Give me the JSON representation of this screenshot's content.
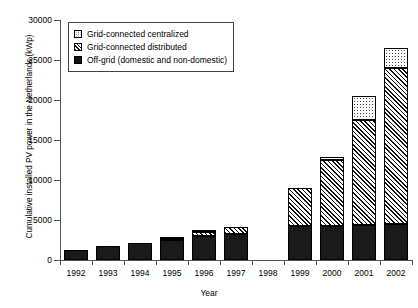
{
  "chart_data": {
    "type": "bar",
    "stacked": true,
    "title": "",
    "xlabel": "Year",
    "ylabel": "Cumulative installed PV power in the Netherlands (kWp)",
    "categories": [
      "1992",
      "1993",
      "1994",
      "1995",
      "1996",
      "1997",
      "1998",
      "1999",
      "2000",
      "2001",
      "2002"
    ],
    "ylim": [
      0,
      30000
    ],
    "yticks": [
      0,
      5000,
      10000,
      15000,
      20000,
      25000,
      30000
    ],
    "ytick_labels": [
      "0",
      "5000",
      "10000",
      "15000",
      "20000",
      "25000",
      "30000"
    ],
    "grid": false,
    "legend_position": "top-left",
    "series": [
      {
        "name": "Off-grid (domestic and non-domestic)",
        "pattern": "solid-black",
        "values": [
          1300,
          1700,
          2100,
          2500,
          3000,
          3300,
          null,
          4200,
          4300,
          4400,
          4500
        ]
      },
      {
        "name": "Grid-connected distributed",
        "pattern": "diagonal-hatch",
        "values": [
          0,
          0,
          0,
          150,
          500,
          800,
          null,
          4800,
          8200,
          13100,
          19500
        ]
      },
      {
        "name": "Grid-connected centralized",
        "pattern": "dotted",
        "values": [
          0,
          0,
          0,
          100,
          250,
          0,
          null,
          0,
          350,
          3000,
          2500
        ]
      }
    ],
    "totals": [
      1300,
      1700,
      2100,
      2750,
      3750,
      4100,
      null,
      9000,
      12850,
      20500,
      26500
    ]
  },
  "legend": {
    "entries": [
      {
        "label": "Grid-connected centralized",
        "swatch": "dotted-square-icon"
      },
      {
        "label": "Grid-connected distributed",
        "swatch": "hatched-square-icon"
      },
      {
        "label": "Off-grid (domestic and non-domestic)",
        "swatch": "filled-square-icon"
      }
    ]
  }
}
